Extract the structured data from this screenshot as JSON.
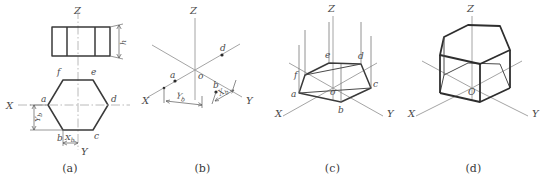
{
  "figure": {
    "panels": [
      {
        "id": "a",
        "caption": "(a)",
        "description": "Orthographic front view and top view with coordinate dimensions",
        "axis_labels": {
          "z": "Z",
          "x": "X",
          "y": "Y"
        },
        "vertex_labels": [
          "a",
          "b",
          "c",
          "d",
          "e",
          "f"
        ],
        "origin_label": "o",
        "dimensions": [
          {
            "name": "height",
            "label": "h",
            "sub": ""
          },
          {
            "name": "y-offset-of-b",
            "label": "Y",
            "sub": "b"
          },
          {
            "name": "x-offset-of-b",
            "label": "X",
            "sub": "b"
          }
        ]
      },
      {
        "id": "b",
        "caption": "(b)",
        "description": "Isometric axes drawn and points a, b, d located by coordinates",
        "axis_labels": {
          "z": "Z",
          "x": "X",
          "y": "Y"
        },
        "origin_label": "o",
        "point_labels": [
          "a",
          "b",
          "d"
        ],
        "dimensions": [
          {
            "name": "y-offset-of-b",
            "label": "Y",
            "sub": "b"
          },
          {
            "name": "x-offset-of-b",
            "label": "X",
            "sub": "b"
          }
        ]
      },
      {
        "id": "c",
        "caption": "(c)",
        "description": "Base hexagon completed and vertical prism edges projected upward",
        "axis_labels": {
          "z": "Z",
          "x": "X",
          "y": "Y"
        },
        "origin_label": "o",
        "vertex_labels": [
          "a",
          "b",
          "c",
          "d",
          "e",
          "f"
        ]
      },
      {
        "id": "d",
        "caption": "(d)",
        "description": "Finished isometric drawing of the hexagonal prism",
        "axis_labels": {
          "z": "Z",
          "x": "X",
          "y": "Y"
        },
        "origin_label": "O"
      }
    ]
  },
  "colors": {
    "outline": "#3a3a3a",
    "bold_outline": "#2e2e2e",
    "axis": "#9a9a9a",
    "centerline": "#a8a8a8",
    "dimension": "#5a5a5a",
    "text": "#4a4a4a",
    "background": "#ffffff"
  }
}
